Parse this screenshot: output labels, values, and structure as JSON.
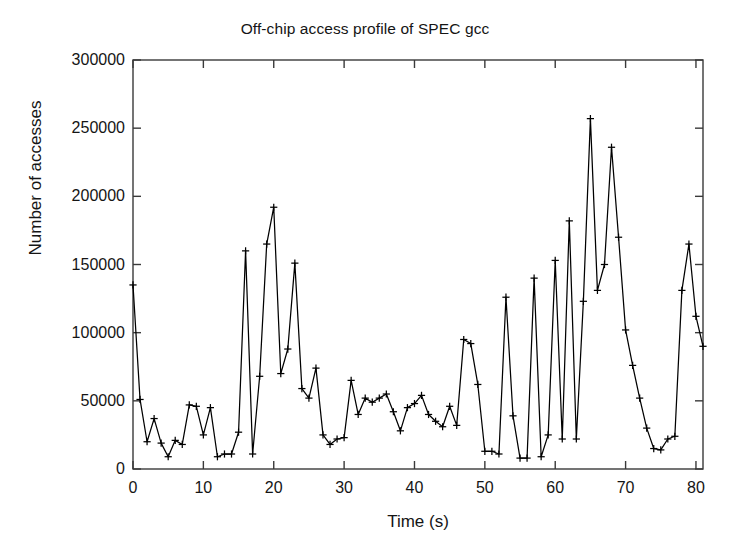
{
  "chart_data": {
    "type": "line",
    "title": "Off-chip access profile of SPEC gcc",
    "xlabel": "Time (s)",
    "ylabel": "Number of accesses",
    "xlim": [
      0,
      81
    ],
    "ylim": [
      0,
      300000
    ],
    "xticks": [
      0,
      10,
      20,
      30,
      40,
      50,
      60,
      70,
      80
    ],
    "yticks": [
      0,
      50000,
      100000,
      150000,
      200000,
      250000,
      300000
    ],
    "grid": false,
    "legend": null,
    "marker": "plus",
    "line_color": "#000000",
    "series": [
      {
        "name": "Off-chip accesses",
        "x": [
          0,
          1,
          2,
          3,
          4,
          5,
          6,
          7,
          8,
          9,
          10,
          11,
          12,
          13,
          14,
          15,
          16,
          17,
          18,
          19,
          20,
          21,
          22,
          23,
          24,
          25,
          26,
          27,
          28,
          29,
          30,
          31,
          32,
          33,
          34,
          35,
          36,
          37,
          38,
          39,
          40,
          41,
          42,
          43,
          44,
          45,
          46,
          47,
          48,
          49,
          50,
          51,
          52,
          53,
          54,
          55,
          56,
          57,
          58,
          59,
          60,
          61,
          62,
          63,
          64,
          65,
          66,
          67,
          68,
          69,
          70,
          71,
          72,
          73,
          74,
          75,
          76,
          77,
          78,
          79,
          80,
          81
        ],
        "values": [
          135000,
          51000,
          20000,
          37000,
          19000,
          9000,
          21000,
          18000,
          47000,
          46000,
          25000,
          45000,
          9000,
          11000,
          11000,
          27000,
          160000,
          11000,
          68000,
          165000,
          192000,
          70000,
          88000,
          151000,
          59000,
          52000,
          74000,
          25000,
          18000,
          22000,
          23000,
          65000,
          40000,
          52000,
          49000,
          52000,
          55000,
          42000,
          28000,
          45000,
          48000,
          54000,
          40000,
          35000,
          31000,
          46000,
          32000,
          95000,
          92000,
          62000,
          13000,
          13000,
          11000,
          126000,
          39000,
          8000,
          8000,
          140000,
          9000,
          25000,
          153000,
          22000,
          182000,
          22000,
          123000,
          257000,
          131000,
          150000,
          236000,
          170000,
          102000,
          76000,
          52000,
          30000,
          15000,
          14000,
          22000,
          24000,
          131000,
          165000,
          112000,
          90000
        ]
      }
    ]
  },
  "axes": {
    "ytick_labels": [
      "300000",
      "250000",
      "200000",
      "150000",
      "100000",
      "50000",
      "0"
    ],
    "xtick_labels": [
      "0",
      "10",
      "20",
      "30",
      "40",
      "50",
      "60",
      "70",
      "80"
    ]
  }
}
